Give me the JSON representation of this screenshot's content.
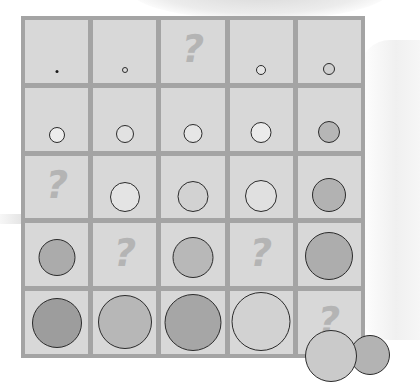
{
  "puzzle": {
    "type": "5x5 circle size/shade sequence with missing cells",
    "colors": {
      "frame": "#a4a4a4",
      "cell": "#d8d8d8",
      "question_mark": "#b4b4b4",
      "outline": "#2b2b2b"
    },
    "cells": [
      {
        "row": 0,
        "col": 0,
        "kind": "circle",
        "size": 3,
        "fill": "#1a1a1a",
        "bottom": 10
      },
      {
        "row": 0,
        "col": 1,
        "kind": "circle",
        "size": 6,
        "fill": "#dcdcdc",
        "bottom": 10
      },
      {
        "row": 0,
        "col": 2,
        "kind": "question",
        "label": "?"
      },
      {
        "row": 0,
        "col": 3,
        "kind": "circle",
        "size": 10,
        "fill": "#e4e4e4",
        "bottom": 8
      },
      {
        "row": 0,
        "col": 4,
        "kind": "circle",
        "size": 12,
        "fill": "#cfcfcf",
        "bottom": 8
      },
      {
        "row": 1,
        "col": 0,
        "kind": "circle",
        "size": 16,
        "fill": "#ececec",
        "bottom": 8
      },
      {
        "row": 1,
        "col": 1,
        "kind": "circle",
        "size": 18,
        "fill": "#e2e2e2",
        "bottom": 8
      },
      {
        "row": 1,
        "col": 2,
        "kind": "circle",
        "size": 19,
        "fill": "#e6e6e6",
        "bottom": 8
      },
      {
        "row": 1,
        "col": 3,
        "kind": "circle",
        "size": 21,
        "fill": "#ebebeb",
        "bottom": 8
      },
      {
        "row": 1,
        "col": 4,
        "kind": "circle",
        "size": 22,
        "fill": "#b6b6b6",
        "bottom": 8
      },
      {
        "row": 2,
        "col": 0,
        "kind": "question",
        "label": "?"
      },
      {
        "row": 2,
        "col": 1,
        "kind": "circle",
        "size": 30,
        "fill": "#e4e4e4",
        "bottom": 6
      },
      {
        "row": 2,
        "col": 2,
        "kind": "circle",
        "size": 31,
        "fill": "#d2d2d2",
        "bottom": 6
      },
      {
        "row": 2,
        "col": 3,
        "kind": "circle",
        "size": 32,
        "fill": "#e0e0e0",
        "bottom": 6
      },
      {
        "row": 2,
        "col": 4,
        "kind": "circle",
        "size": 34,
        "fill": "#b2b2b2",
        "bottom": 6
      },
      {
        "row": 3,
        "col": 0,
        "kind": "circle",
        "size": 37,
        "fill": "#ababab",
        "bottom": 10
      },
      {
        "row": 3,
        "col": 1,
        "kind": "question",
        "label": "?"
      },
      {
        "row": 3,
        "col": 2,
        "kind": "circle",
        "size": 41,
        "fill": "#b8b8b8",
        "bottom": 8
      },
      {
        "row": 3,
        "col": 3,
        "kind": "question",
        "label": "?"
      },
      {
        "row": 3,
        "col": 4,
        "kind": "circle",
        "size": 48,
        "fill": "#adadad",
        "bottom": 6
      },
      {
        "row": 4,
        "col": 0,
        "kind": "circle",
        "size": 50,
        "fill": "#9d9d9d",
        "bottom": 6
      },
      {
        "row": 4,
        "col": 1,
        "kind": "circle",
        "size": 54,
        "fill": "#b7b7b7",
        "bottom": 5
      },
      {
        "row": 4,
        "col": 2,
        "kind": "circle",
        "size": 57,
        "fill": "#a6a6a6",
        "bottom": 3
      },
      {
        "row": 4,
        "col": 3,
        "kind": "circle",
        "size": 59,
        "fill": "#d2d2d2",
        "bottom": 3
      },
      {
        "row": 4,
        "col": 4,
        "kind": "question",
        "label": "?"
      }
    ],
    "answer_circles": [
      {
        "left": 305,
        "top": 330,
        "size": 52,
        "fill": "#cacaca"
      },
      {
        "left": 350,
        "top": 335,
        "size": 40,
        "fill": "#b3b3b3"
      }
    ]
  }
}
